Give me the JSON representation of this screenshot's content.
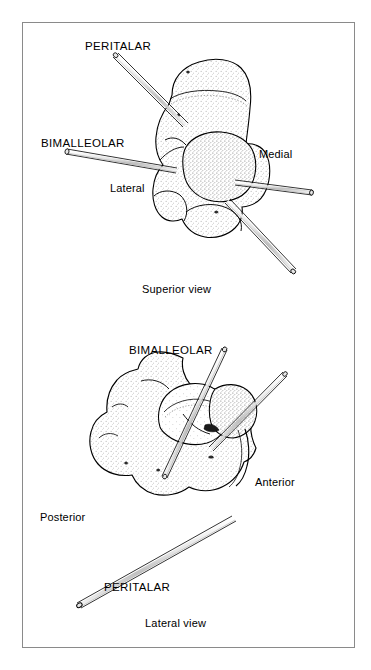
{
  "figure": {
    "border_color": "#8a8a8a",
    "background_color": "#ffffff",
    "ink_color": "#000000",
    "pin_fill_color": "#d9d9d9",
    "stipple_color": "#6e6e6e"
  },
  "panels": [
    {
      "id": "superior",
      "caption": "Superior view",
      "labels": {
        "peritalar": "PERITALAR",
        "bimalleolar": "BIMALLEOLAR",
        "lateral": "Lateral",
        "medial": "Medial"
      }
    },
    {
      "id": "lateral",
      "caption": "Lateral view",
      "labels": {
        "bimalleolar": "BIMALLEOLAR",
        "posterior": "Posterior",
        "anterior": "Anterior",
        "peritalar": "PERITALAR"
      }
    }
  ]
}
